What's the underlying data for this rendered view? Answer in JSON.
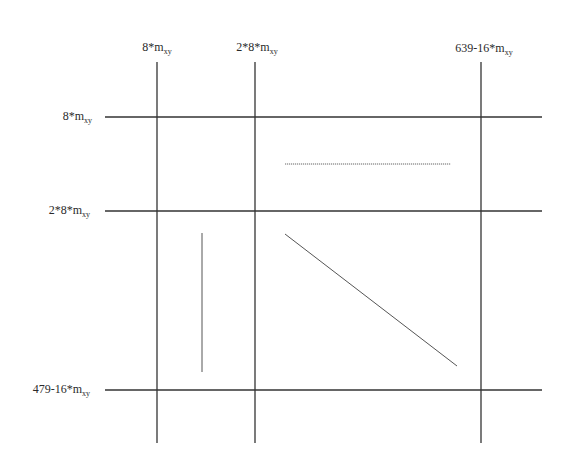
{
  "diagram": {
    "column_labels": [
      {
        "base": "8*m",
        "sub": "xy",
        "x": 157
      },
      {
        "base": "2*8*m",
        "sub": "xy",
        "x": 255
      },
      {
        "base": "639-16*m",
        "sub": "xy",
        "x": 481
      }
    ],
    "row_labels": [
      {
        "base": "8*m",
        "sub": "xy",
        "y": 117
      },
      {
        "base": "2*8*m",
        "sub": "xy",
        "y": 211
      },
      {
        "base": "479-16*m",
        "sub": "xy",
        "y": 390
      }
    ],
    "grid": {
      "vertical_x": [
        157,
        255,
        481
      ],
      "vertical_y_range": [
        62,
        443
      ],
      "horizontal_y": [
        117,
        211,
        390
      ],
      "horizontal_x_range": [
        105,
        542
      ],
      "color": "#333333"
    },
    "segments": [
      {
        "name": "dotted-horizontal-segment",
        "x1": 285,
        "y1": 164,
        "x2": 451,
        "y2": 164,
        "style": "dotted",
        "color": "#666666"
      },
      {
        "name": "vertical-segment",
        "x1": 202,
        "y1": 233,
        "x2": 202,
        "y2": 372,
        "style": "solid",
        "color": "#555555"
      },
      {
        "name": "diagonal-segment",
        "x1": 285,
        "y1": 234,
        "x2": 457,
        "y2": 366,
        "style": "solid",
        "color": "#555555"
      }
    ]
  }
}
